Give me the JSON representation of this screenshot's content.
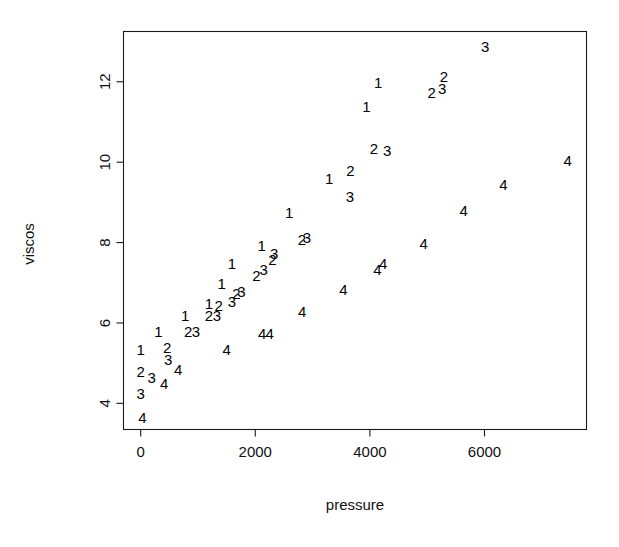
{
  "chart_data": {
    "type": "scatter",
    "title": "",
    "xlabel": "pressure",
    "ylabel": "viscos",
    "xlim": [
      -300,
      7780
    ],
    "ylim": [
      3.35,
      13.25
    ],
    "grid": false,
    "legend": "none",
    "xticks": [
      0,
      2000,
      4000,
      6000
    ],
    "xtick_labels": [
      "0",
      "2000",
      "4000",
      "6000"
    ],
    "yticks": [
      4,
      6,
      8,
      10,
      12
    ],
    "ytick_labels": [
      "4",
      "6",
      "8",
      "10",
      "12"
    ],
    "point_marker": "group-number-glyph",
    "note": "Each plotted symbol is the digit of its group (1-4); x = pressure, y = viscos",
    "series": [
      {
        "name": "1",
        "label": "1",
        "points": [
          {
            "x": 0,
            "y": 5.3
          },
          {
            "x": 310,
            "y": 5.75
          },
          {
            "x": 775,
            "y": 6.15
          },
          {
            "x": 1190,
            "y": 6.45
          },
          {
            "x": 1415,
            "y": 6.95
          },
          {
            "x": 1590,
            "y": 7.45
          },
          {
            "x": 2110,
            "y": 7.9
          },
          {
            "x": 2590,
            "y": 8.7
          },
          {
            "x": 3290,
            "y": 9.55
          },
          {
            "x": 3940,
            "y": 11.35
          },
          {
            "x": 4145,
            "y": 11.95
          }
        ]
      },
      {
        "name": "2",
        "label": "2",
        "points": [
          {
            "x": 0,
            "y": 4.75
          },
          {
            "x": 460,
            "y": 5.35
          },
          {
            "x": 830,
            "y": 5.75
          },
          {
            "x": 1190,
            "y": 6.15
          },
          {
            "x": 1360,
            "y": 6.4
          },
          {
            "x": 1670,
            "y": 6.7
          },
          {
            "x": 2020,
            "y": 7.15
          },
          {
            "x": 2300,
            "y": 7.55
          },
          {
            "x": 2815,
            "y": 8.05
          },
          {
            "x": 3660,
            "y": 9.75
          },
          {
            "x": 4070,
            "y": 10.3
          },
          {
            "x": 5080,
            "y": 11.7
          },
          {
            "x": 5290,
            "y": 12.1
          }
        ]
      },
      {
        "name": "3",
        "label": "3",
        "points": [
          {
            "x": 0,
            "y": 4.2
          },
          {
            "x": 190,
            "y": 4.6
          },
          {
            "x": 480,
            "y": 5.05
          },
          {
            "x": 965,
            "y": 5.75
          },
          {
            "x": 1330,
            "y": 6.15
          },
          {
            "x": 1590,
            "y": 6.5
          },
          {
            "x": 1760,
            "y": 6.75
          },
          {
            "x": 2145,
            "y": 7.3
          },
          {
            "x": 2330,
            "y": 7.7
          },
          {
            "x": 2900,
            "y": 8.1
          },
          {
            "x": 3650,
            "y": 9.1
          },
          {
            "x": 4300,
            "y": 10.25
          },
          {
            "x": 5260,
            "y": 11.8
          },
          {
            "x": 6010,
            "y": 12.85
          }
        ]
      },
      {
        "name": "4",
        "label": "4",
        "points": [
          {
            "x": 30,
            "y": 3.6
          },
          {
            "x": 410,
            "y": 4.45
          },
          {
            "x": 655,
            "y": 4.8
          },
          {
            "x": 1500,
            "y": 5.3
          },
          {
            "x": 2120,
            "y": 5.7
          },
          {
            "x": 2250,
            "y": 5.7
          },
          {
            "x": 2820,
            "y": 6.25
          },
          {
            "x": 3540,
            "y": 6.8
          },
          {
            "x": 4130,
            "y": 7.3
          },
          {
            "x": 4230,
            "y": 7.45
          },
          {
            "x": 4940,
            "y": 7.95
          },
          {
            "x": 5635,
            "y": 8.75
          },
          {
            "x": 6330,
            "y": 9.4
          },
          {
            "x": 7450,
            "y": 10.0
          }
        ]
      }
    ]
  }
}
